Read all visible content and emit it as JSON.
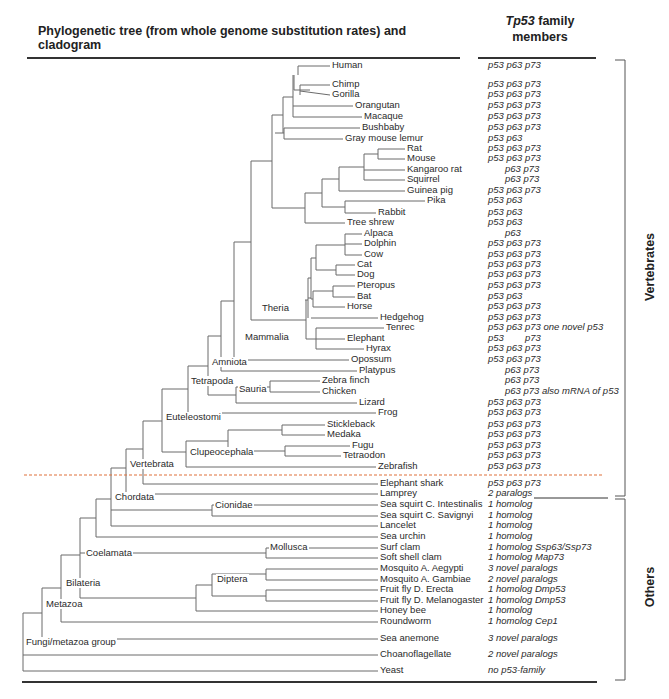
{
  "header": {
    "tree_title": "Phylogenetic tree (from whole genome substitution rates) and cladogram",
    "family_title_gene": "Tp53",
    "family_title_rest": " family",
    "family_title_line2": "members"
  },
  "groups": {
    "vertebrates": "Vertebrates",
    "others": "Others"
  },
  "colors": {
    "line": "#6b6b6b",
    "text": "#2a2a2a",
    "divider": "#e0703a"
  },
  "leaves": [
    {
      "name": "Human",
      "x": 330,
      "y": 66,
      "family": "p53 p63 p73"
    },
    {
      "name": "Chimp",
      "x": 330,
      "y": 85,
      "family": "p53 p63 p73"
    },
    {
      "name": "Gorilla",
      "x": 330,
      "y": 95,
      "family": "p53 p63 p73"
    },
    {
      "name": "Orangutan",
      "x": 353,
      "y": 106,
      "family": "p53 p63 p73"
    },
    {
      "name": "Macaque",
      "x": 362,
      "y": 117,
      "family": "p53 p63 p73"
    },
    {
      "name": "Bushbaby",
      "x": 360,
      "y": 128,
      "family": "p53 p63 p73"
    },
    {
      "name": "Gray mouse lemur",
      "x": 343,
      "y": 139,
      "family": "p53 p63"
    },
    {
      "name": "Rat",
      "x": 405,
      "y": 149,
      "family": "p53 p63 p73"
    },
    {
      "name": "Mouse",
      "x": 405,
      "y": 159,
      "family": "p53 p63 p73"
    },
    {
      "name": "Kangaroo rat",
      "x": 405,
      "y": 170,
      "family": "p63 p73",
      "indent": 17
    },
    {
      "name": "Squirrel",
      "x": 405,
      "y": 180,
      "family": "p63 p73",
      "indent": 17
    },
    {
      "name": "Guinea pig",
      "x": 405,
      "y": 191,
      "family": "p53 p63 p73"
    },
    {
      "name": "Pika",
      "x": 425,
      "y": 201,
      "family": "p53 p63"
    },
    {
      "name": "Rabbit",
      "x": 376,
      "y": 213,
      "family": "p53 p63"
    },
    {
      "name": "Tree shrew",
      "x": 345,
      "y": 223,
      "family": "p53 p63"
    },
    {
      "name": "Alpaca",
      "x": 362,
      "y": 234,
      "family": "p63",
      "indent": 17
    },
    {
      "name": "Dolphin",
      "x": 362,
      "y": 244,
      "family": "p53 p63 p73"
    },
    {
      "name": "Cow",
      "x": 362,
      "y": 255,
      "family": "p53 p63 p73"
    },
    {
      "name": "Cat",
      "x": 355,
      "y": 265,
      "family": "p53 p63 p73"
    },
    {
      "name": "Dog",
      "x": 355,
      "y": 275,
      "family": "p53 p63 p73"
    },
    {
      "name": "Pteropus",
      "x": 355,
      "y": 286,
      "family": "p53 p63 p73"
    },
    {
      "name": "Bat",
      "x": 355,
      "y": 297,
      "family": "p53 p63"
    },
    {
      "name": "Horse",
      "x": 345,
      "y": 307,
      "family": "p53 p63 p73"
    },
    {
      "name": "Hedgehog",
      "x": 378,
      "y": 318,
      "family": "p53 p63 p73"
    },
    {
      "name": "Tenrec",
      "x": 384,
      "y": 328,
      "family": "p53 p63 p73 one novel p53"
    },
    {
      "name": "Elephant",
      "x": 345,
      "y": 339,
      "family": "p53        p73"
    },
    {
      "name": "Hyrax",
      "x": 364,
      "y": 349,
      "family": "p53 p63 p73"
    },
    {
      "name": "Opossum",
      "x": 349,
      "y": 360,
      "family": "p53 p63 p73"
    },
    {
      "name": "Platypus",
      "x": 357,
      "y": 371,
      "family": "p63 p73",
      "indent": 17
    },
    {
      "name": "Zebra finch",
      "x": 320,
      "y": 381,
      "family": "p63 p73",
      "indent": 17
    },
    {
      "name": "Chicken",
      "x": 320,
      "y": 392,
      "family": "p63 p73 also mRNA of p53",
      "indent": 17
    },
    {
      "name": "Lizard",
      "x": 357,
      "y": 403,
      "family": "p53 p63 p73"
    },
    {
      "name": "Frog",
      "x": 376,
      "y": 413,
      "family": "p53 p63 p73"
    },
    {
      "name": "Stickleback",
      "x": 325,
      "y": 425,
      "family": "p53 p63 p73"
    },
    {
      "name": "Medaka",
      "x": 325,
      "y": 435,
      "family": "p53 p63 p73"
    },
    {
      "name": "Fugu",
      "x": 350,
      "y": 446,
      "family": "p53 p63 p73"
    },
    {
      "name": "Tetraodon",
      "x": 341,
      "y": 456,
      "family": "p53 p63 p73"
    },
    {
      "name": "Zebrafish",
      "x": 376,
      "y": 467,
      "family": "p53 p63 p73"
    },
    {
      "name": "Elephant shark",
      "x": 378,
      "y": 484,
      "family": "p53 p63 p73"
    },
    {
      "name": "Lamprey",
      "x": 378,
      "y": 494,
      "family": "2 paralogs"
    },
    {
      "name": "Sea squirt C. Intestinalis",
      "x": 378,
      "y": 505,
      "family": "1 homolog"
    },
    {
      "name": "Sea squirt C. Savignyi",
      "x": 378,
      "y": 516,
      "family": "1 homolog"
    },
    {
      "name": "Lancelet",
      "x": 378,
      "y": 526,
      "family": "1 homolog"
    },
    {
      "name": "Sea urchin",
      "x": 378,
      "y": 537,
      "family": "1 homolog"
    },
    {
      "name": "Surf clam",
      "x": 378,
      "y": 548,
      "family": "1 homolog Ssp63/Ssp73"
    },
    {
      "name": "Soft shell clam",
      "x": 378,
      "y": 558,
      "family": "1 homolog Map73"
    },
    {
      "name": "Mosquito A. Aegypti",
      "x": 378,
      "y": 569,
      "family": "3 novel paralogs"
    },
    {
      "name": "Mosquito A. Gambiae",
      "x": 378,
      "y": 580,
      "family": "2 novel paralogs"
    },
    {
      "name": "Fruit fly D. Erecta",
      "x": 378,
      "y": 590,
      "family": "1 homolog Dmp53"
    },
    {
      "name": "Fruit fly D. Melanogaster",
      "x": 378,
      "y": 601,
      "family": "1 homolog Dmp53"
    },
    {
      "name": "Honey bee",
      "x": 378,
      "y": 611,
      "family": "1 homolog"
    },
    {
      "name": "Roundworm",
      "x": 378,
      "y": 622,
      "family": "1 homolog Cep1"
    },
    {
      "name": "Sea anemone",
      "x": 378,
      "y": 639,
      "family": "3 novel paralogs"
    },
    {
      "name": "Choanoflagellate",
      "x": 378,
      "y": 655,
      "family": "2 novel paralogs"
    },
    {
      "name": "Yeast",
      "x": 378,
      "y": 671,
      "family": "no p53-family"
    }
  ],
  "clades": [
    {
      "name": "Theria",
      "x": 260,
      "y": 309
    },
    {
      "name": "Mammalia",
      "x": 243,
      "y": 338
    },
    {
      "name": "Amniota",
      "x": 210,
      "y": 363
    },
    {
      "name": "Tetrapoda",
      "x": 189,
      "y": 382
    },
    {
      "name": "Sauria",
      "x": 237,
      "y": 390
    },
    {
      "name": "Euteleostomi",
      "x": 164,
      "y": 418
    },
    {
      "name": "Clupeocephala",
      "x": 188,
      "y": 453
    },
    {
      "name": "Vertebrata",
      "x": 128,
      "y": 465
    },
    {
      "name": "Chordata",
      "x": 113,
      "y": 498
    },
    {
      "name": "Cionidae",
      "x": 213,
      "y": 506
    },
    {
      "name": "Coelamata",
      "x": 84,
      "y": 554
    },
    {
      "name": "Mollusca",
      "x": 268,
      "y": 548
    },
    {
      "name": "Diptera",
      "x": 215,
      "y": 580
    },
    {
      "name": "Bilateria",
      "x": 64,
      "y": 584
    },
    {
      "name": "Metazoa",
      "x": 44,
      "y": 605
    },
    {
      "name": "Fungi/metazoa group",
      "x": 24,
      "y": 643
    }
  ],
  "tree_segments": [
    [
      298,
      66,
      330,
      66
    ],
    [
      298,
      66,
      298,
      75
    ],
    [
      300,
      85,
      330,
      85
    ],
    [
      300,
      91,
      330,
      95
    ],
    [
      300,
      85,
      300,
      95
    ],
    [
      294,
      75,
      294,
      90
    ],
    [
      294,
      90,
      310,
      90
    ],
    [
      293,
      106,
      353,
      106
    ],
    [
      293,
      117,
      362,
      117
    ],
    [
      293,
      75,
      293,
      117
    ],
    [
      283,
      97,
      293,
      97
    ],
    [
      284,
      128,
      360,
      128
    ],
    [
      284,
      139,
      343,
      139
    ],
    [
      284,
      128,
      284,
      139
    ],
    [
      275,
      133,
      284,
      133
    ],
    [
      283,
      97,
      283,
      133
    ],
    [
      272,
      115,
      283,
      115
    ],
    [
      378,
      149,
      405,
      149
    ],
    [
      378,
      159,
      405,
      159
    ],
    [
      378,
      149,
      378,
      159
    ],
    [
      364,
      154,
      378,
      154
    ],
    [
      364,
      170,
      405,
      170
    ],
    [
      364,
      180,
      405,
      180
    ],
    [
      364,
      154,
      364,
      180
    ],
    [
      339,
      167,
      364,
      167
    ],
    [
      339,
      191,
      405,
      191
    ],
    [
      339,
      167,
      339,
      191
    ],
    [
      322,
      179,
      339,
      179
    ],
    [
      345,
      201,
      425,
      201
    ],
    [
      345,
      213,
      376,
      213
    ],
    [
      345,
      201,
      345,
      213
    ],
    [
      322,
      207,
      345,
      207
    ],
    [
      322,
      179,
      322,
      207
    ],
    [
      305,
      193,
      322,
      193
    ],
    [
      305,
      223,
      345,
      223
    ],
    [
      305,
      193,
      305,
      223
    ],
    [
      272,
      208,
      305,
      208
    ],
    [
      272,
      115,
      272,
      208
    ],
    [
      251,
      161,
      272,
      161
    ],
    [
      345,
      234,
      362,
      234
    ],
    [
      345,
      244,
      362,
      244
    ],
    [
      345,
      255,
      362,
      255
    ],
    [
      345,
      234,
      345,
      255
    ],
    [
      316,
      245,
      345,
      245
    ],
    [
      336,
      265,
      355,
      265
    ],
    [
      336,
      275,
      355,
      275
    ],
    [
      336,
      265,
      336,
      275
    ],
    [
      316,
      270,
      336,
      270
    ],
    [
      333,
      286,
      355,
      286
    ],
    [
      333,
      297,
      355,
      297
    ],
    [
      333,
      286,
      333,
      297
    ],
    [
      313,
      291,
      333,
      291
    ],
    [
      313,
      307,
      345,
      307
    ],
    [
      316,
      245,
      316,
      270
    ],
    [
      313,
      291,
      313,
      307
    ],
    [
      311,
      258,
      316,
      258
    ],
    [
      311,
      258,
      311,
      299
    ],
    [
      311,
      299,
      313,
      299
    ],
    [
      311,
      318,
      378,
      318
    ],
    [
      308,
      278,
      311,
      278
    ],
    [
      308,
      278,
      308,
      318
    ],
    [
      308,
      298,
      311,
      298
    ],
    [
      308,
      298,
      308,
      298
    ],
    [
      305,
      300,
      308,
      300
    ],
    [
      305,
      300,
      305,
      300
    ],
    [
      316,
      328,
      384,
      328
    ],
    [
      316,
      349,
      364,
      349
    ],
    [
      316,
      328,
      316,
      349
    ],
    [
      316,
      339,
      345,
      339
    ],
    [
      306,
      339,
      316,
      339
    ],
    [
      306,
      300,
      306,
      339
    ],
    [
      251,
      320,
      306,
      320
    ],
    [
      251,
      161,
      251,
      320
    ],
    [
      234,
      242,
      251,
      242
    ],
    [
      234,
      360,
      349,
      360
    ],
    [
      234,
      242,
      234,
      360
    ],
    [
      221,
      301,
      234,
      301
    ],
    [
      221,
      371,
      357,
      371
    ],
    [
      221,
      301,
      221,
      371
    ],
    [
      270,
      381,
      320,
      381
    ],
    [
      270,
      392,
      320,
      392
    ],
    [
      270,
      381,
      270,
      392
    ],
    [
      236,
      387,
      270,
      387
    ],
    [
      236,
      403,
      357,
      403
    ],
    [
      236,
      387,
      236,
      403
    ],
    [
      208,
      395,
      236,
      395
    ],
    [
      208,
      336,
      221,
      336
    ],
    [
      208,
      336,
      208,
      395
    ],
    [
      188,
      366,
      208,
      366
    ],
    [
      188,
      413,
      376,
      413
    ],
    [
      188,
      366,
      188,
      413
    ],
    [
      282,
      425,
      325,
      425
    ],
    [
      282,
      435,
      325,
      435
    ],
    [
      282,
      425,
      282,
      435
    ],
    [
      228,
      430,
      282,
      430
    ],
    [
      285,
      446,
      350,
      446
    ],
    [
      285,
      456,
      341,
      456
    ],
    [
      285,
      446,
      285,
      456
    ],
    [
      228,
      451,
      285,
      451
    ],
    [
      228,
      430,
      228,
      451
    ],
    [
      186,
      441,
      228,
      441
    ],
    [
      186,
      467,
      376,
      467
    ],
    [
      186,
      441,
      186,
      467
    ],
    [
      162,
      389,
      188,
      389
    ],
    [
      162,
      452,
      186,
      452
    ],
    [
      162,
      389,
      162,
      452
    ],
    [
      143,
      421,
      162,
      421
    ],
    [
      143,
      484,
      378,
      484
    ],
    [
      143,
      421,
      143,
      484
    ],
    [
      126,
      449,
      143,
      449
    ],
    [
      126,
      494,
      378,
      494
    ],
    [
      126,
      449,
      126,
      494
    ],
    [
      111,
      468,
      126,
      468
    ],
    [
      212,
      505,
      378,
      505
    ],
    [
      212,
      516,
      378,
      516
    ],
    [
      212,
      505,
      212,
      516
    ],
    [
      111,
      510,
      212,
      510
    ],
    [
      111,
      526,
      378,
      526
    ],
    [
      111,
      468,
      111,
      526
    ],
    [
      96,
      499,
      111,
      499
    ],
    [
      96,
      537,
      378,
      537
    ],
    [
      96,
      499,
      96,
      537
    ],
    [
      80,
      518,
      96,
      518
    ],
    [
      266,
      548,
      378,
      548
    ],
    [
      266,
      558,
      378,
      558
    ],
    [
      266,
      548,
      266,
      558
    ],
    [
      80,
      553,
      266,
      553
    ],
    [
      266,
      569,
      378,
      569
    ],
    [
      266,
      580,
      378,
      580
    ],
    [
      266,
      569,
      266,
      580
    ],
    [
      212,
      574,
      266,
      574
    ],
    [
      266,
      590,
      378,
      590
    ],
    [
      266,
      601,
      378,
      601
    ],
    [
      266,
      590,
      266,
      601
    ],
    [
      212,
      596,
      266,
      596
    ],
    [
      212,
      574,
      212,
      596
    ],
    [
      196,
      585,
      212,
      585
    ],
    [
      196,
      611,
      378,
      611
    ],
    [
      196,
      585,
      196,
      611
    ],
    [
      80,
      598,
      196,
      598
    ],
    [
      80,
      518,
      80,
      598
    ],
    [
      61,
      555,
      80,
      555
    ],
    [
      61,
      622,
      378,
      622
    ],
    [
      61,
      555,
      61,
      622
    ],
    [
      42,
      588,
      61,
      588
    ],
    [
      42,
      639,
      378,
      639
    ],
    [
      42,
      588,
      42,
      639
    ],
    [
      23,
      613,
      42,
      613
    ],
    [
      23,
      655,
      378,
      655
    ],
    [
      23,
      671,
      378,
      671
    ],
    [
      23,
      613,
      23,
      671
    ]
  ],
  "divider": {
    "y": 475,
    "x1": 24,
    "x2": 602
  },
  "brackets": {
    "vertebrates": {
      "x": 625,
      "y1": 60,
      "y2": 496
    },
    "others": {
      "x": 625,
      "y1": 499,
      "y2": 680
    }
  }
}
